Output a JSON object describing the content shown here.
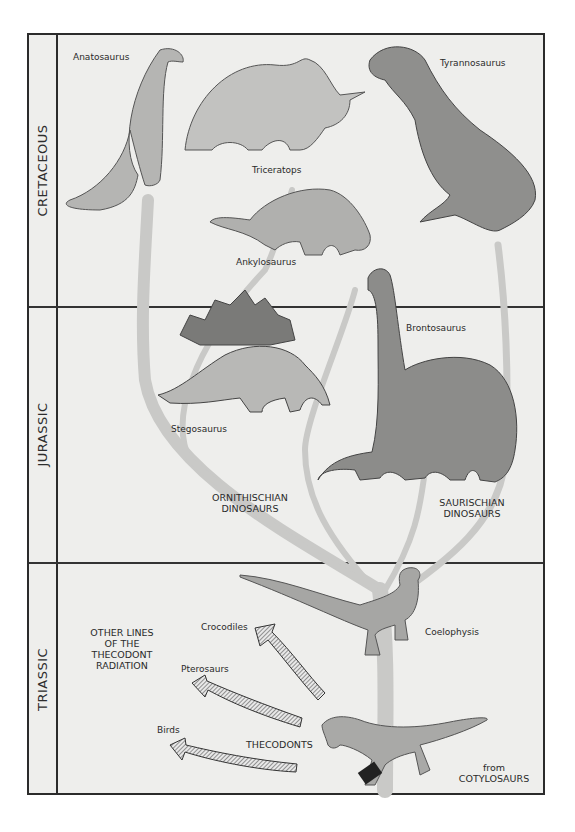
{
  "periods": [
    {
      "name": "CRETACEOUS"
    },
    {
      "name": "JURASSIC"
    },
    {
      "name": "TRIASSIC"
    }
  ],
  "dinosaurs": {
    "anatosaurus": "Anatosaurus",
    "triceratops": "Triceratops",
    "tyrannosaurus": "Tyrannosaurus",
    "ankylosaurus": "Ankylosaurus",
    "brontosaurus": "Brontosaurus",
    "stegosaurus": "Stegosaurus",
    "coelophysis": "Coelophysis"
  },
  "groups": {
    "ornithischian_line1": "ORNITHISCHIAN",
    "ornithischian_line2": "DINOSAURS",
    "saurischian_line1": "SAURISCHIAN",
    "saurischian_line2": "DINOSAURS",
    "thecodonts": "THECODONTS"
  },
  "other_lines": {
    "line1": "OTHER LINES",
    "line2": "OF THE",
    "line3": "THECODONT",
    "line4": "RADIATION",
    "branches": [
      "Crocodiles",
      "Pterosaurs",
      "Birds"
    ]
  },
  "origin": {
    "line1": "from",
    "line2": "COTYLOSAURS"
  },
  "colors": {
    "background": "#eeeeec",
    "frame": "#2b2b2b",
    "branch": "#c9c9c7",
    "animal": "#9a9a98"
  }
}
